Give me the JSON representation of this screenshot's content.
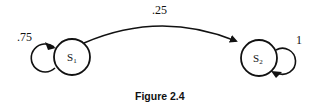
{
  "diagram": {
    "type": "state-transition-diagram",
    "states": [
      {
        "id": "S1",
        "label": "S",
        "subscript": "1"
      },
      {
        "id": "S2",
        "label": "S",
        "subscript": "2"
      }
    ],
    "transitions": [
      {
        "from": "S1",
        "to": "S1",
        "label": ".75"
      },
      {
        "from": "S1",
        "to": "S2",
        "label": ".25"
      },
      {
        "from": "S2",
        "to": "S2",
        "label": "1"
      }
    ],
    "caption": "Figure 2.4"
  }
}
